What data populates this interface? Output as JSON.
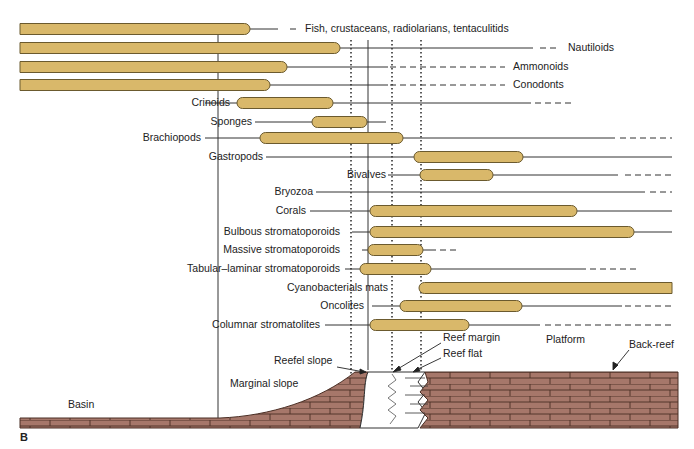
{
  "figure": {
    "panel_label": "B",
    "colors": {
      "range_bar_fill": "#D9B86A",
      "range_bar_stroke": "#6B5A2E",
      "limestone_fill": "#A6776A",
      "limestone_stroke": "#4A2E24",
      "line": "#333333",
      "text": "#222222"
    },
    "taxa": [
      {
        "label": "Fish, crustaceans, radiolarians, tentaculitids",
        "y": 29,
        "bar": [
          20,
          250
        ],
        "line_to": 278,
        "dash": [
          290,
          300
        ],
        "label_x": 305,
        "label_side": "right"
      },
      {
        "label": "Nautiloids",
        "y": 48,
        "bar": [
          20,
          340
        ],
        "line_to": 533,
        "dash": [
          540,
          560
        ],
        "label_x": 568,
        "label_side": "right"
      },
      {
        "label": "Ammonoids",
        "y": 67,
        "bar": [
          20,
          287
        ],
        "line_to": 388,
        "dash": [
          390,
          505
        ],
        "label_x": 513,
        "label_side": "right"
      },
      {
        "label": "Conodonts",
        "y": 85,
        "bar": [
          20,
          270
        ],
        "line_to": 388,
        "dash": [
          390,
          505
        ],
        "label_x": 513,
        "label_side": "right"
      },
      {
        "label": "Crinoids",
        "y": 103,
        "bar": [
          237,
          333
        ],
        "line_to": 525,
        "dash": [
          525,
          575
        ],
        "label_x": 230,
        "label_side": "left",
        "tick_from": 205
      },
      {
        "label": "Sponges",
        "y": 122,
        "bar": [
          312,
          367
        ],
        "line_to": 386,
        "dash": null,
        "label_x": 252,
        "label_side": "left",
        "tick_from": 255
      },
      {
        "label": "Brachiopods",
        "y": 138,
        "bar": [
          260,
          403
        ],
        "line_to": 615,
        "dash": [
          620,
          672
        ],
        "label_x": 201,
        "label_side": "left",
        "tick_from": 205
      },
      {
        "label": "Gastropods",
        "y": 157,
        "bar": [
          414,
          523
        ],
        "line_to": 672,
        "dash": null,
        "label_x": 263,
        "label_side": "left",
        "tick_from": 266
      },
      {
        "label": "Bivalves",
        "y": 175,
        "bar": [
          420,
          493
        ],
        "line_to": 618,
        "dash": [
          625,
          672
        ],
        "label_x": 386,
        "label_side": "left",
        "tick_from": 388
      },
      {
        "label": "Bryozoa",
        "y": 192,
        "bar": null,
        "line_to": 645,
        "dash": [
          650,
          672
        ],
        "label_x": 313,
        "label_side": "left",
        "tick_from": 316,
        "line_from": 316
      },
      {
        "label": "Corals",
        "y": 211,
        "bar": [
          370,
          577
        ],
        "line_to": 672,
        "dash": null,
        "label_x": 306,
        "label_side": "left",
        "tick_from": 310
      },
      {
        "label": "Bulbous stromatoporoids",
        "y": 232,
        "bar": [
          370,
          634
        ],
        "line_to": 672,
        "dash": null,
        "label_x": 340,
        "label_side": "left",
        "tick_from": 352
      },
      {
        "label": "Massive stromatoporoids",
        "y": 250,
        "bar": [
          368,
          423
        ],
        "line_to": 430,
        "dash": [
          430,
          456
        ],
        "label_x": 340,
        "label_side": "left",
        "tick_from": 362
      },
      {
        "label": "Tabular–laminar stromatoporoids",
        "y": 269,
        "bar": [
          360,
          431
        ],
        "line_to": 586,
        "dash": [
          590,
          638
        ],
        "label_x": 340,
        "label_side": "left",
        "tick_from": 345
      },
      {
        "label": "Cyanobacterials mats",
        "y": 288,
        "bar": [
          419,
          672
        ],
        "line_to": 672,
        "dash": null,
        "label_x": 388,
        "label_side": "left",
        "square_end": true
      },
      {
        "label": "Oncolites",
        "y": 306,
        "bar": [
          400,
          522
        ],
        "line_to": 622,
        "dash": [
          625,
          672
        ],
        "label_x": 364,
        "label_side": "left",
        "tick_from": 372
      },
      {
        "label": "Columnar stromatolites",
        "y": 325,
        "bar": [
          370,
          469
        ],
        "line_to": 540,
        "dash": [
          545,
          672
        ],
        "label_x": 320,
        "label_side": "left",
        "tick_from": 325
      }
    ],
    "zone_labels": [
      {
        "label": "Basin",
        "x": 68,
        "y": 405
      },
      {
        "label": "Marginal slope",
        "x": 230,
        "y": 384
      },
      {
        "label": "Reefel slope",
        "x": 274,
        "y": 361
      },
      {
        "label": "Reef margin",
        "x": 443,
        "y": 338
      },
      {
        "label": "Reef flat",
        "x": 443,
        "y": 354
      },
      {
        "label": "Platform",
        "x": 546,
        "y": 340
      },
      {
        "label": "Back-reef",
        "x": 629,
        "y": 345
      }
    ]
  }
}
